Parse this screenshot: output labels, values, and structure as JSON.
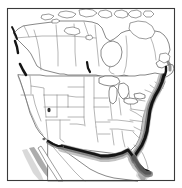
{
  "figure": {
    "title": "Map of North America",
    "subtitle": "United States and Canada with state and province boundaries",
    "width_px": 182,
    "height_px": 188,
    "background_color": "#ffffff",
    "frame": {
      "label": "map border frame",
      "color": "#3a3a3a",
      "stroke_width": 1.1,
      "x": 7,
      "y": 8,
      "width": 168,
      "height": 173
    }
  },
  "legend_items": [
    {
      "name": "land",
      "label": "Land area",
      "color": "#ffffff",
      "outline": "#555555"
    },
    {
      "name": "subdivision-boundary",
      "label": "State / province boundary",
      "color": "#7b7b7b"
    },
    {
      "name": "dark-coastal-band",
      "label": "Atlantic and Gulf coastal band",
      "color": "#141414"
    },
    {
      "name": "gray-shading",
      "label": "Southwest coastal shading",
      "color": "#9d9d9d"
    },
    {
      "name": "great-lakes",
      "label": "Great Lakes",
      "color": "#ffffff"
    }
  ],
  "regions": [
    {
      "name": "canada",
      "label": "Canada"
    },
    {
      "name": "united-states",
      "label": "United States"
    },
    {
      "name": "mexico-north",
      "label": "Northern Mexico"
    },
    {
      "name": "canadian-arctic-islands",
      "label": "Canadian Arctic Archipelago"
    },
    {
      "name": "great-lakes",
      "label": "Great Lakes"
    },
    {
      "name": "hudson-bay",
      "label": "Hudson Bay"
    },
    {
      "name": "baja-california",
      "label": "Baja California"
    },
    {
      "name": "florida-peninsula",
      "label": "Florida Peninsula"
    },
    {
      "name": "atlantic-coast",
      "label": "Atlantic Coast"
    },
    {
      "name": "gulf-coast",
      "label": "Gulf Coast"
    },
    {
      "name": "pacific-northwest-coast",
      "label": "Pacific Northwest Coast"
    }
  ],
  "colors": {
    "frame": "#3a3a3a",
    "coastline": "#555555",
    "boundary": "#7b7b7b",
    "dark_band": "#141414",
    "mid_band": "#6e6e6e",
    "soft_band": "#b4b4b4",
    "shade_gray": "#9d9d9d",
    "shade_light": "#cfcfcf",
    "background": "#ffffff"
  }
}
